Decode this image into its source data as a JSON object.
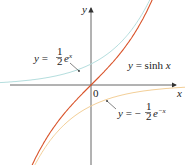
{
  "chart_data": {
    "type": "line",
    "title": "",
    "xlabel": "x",
    "ylabel": "y",
    "origin_label": "0",
    "xlim": [
      -2.2,
      2.0
    ],
    "ylim": [
      -1.9,
      2.0
    ],
    "grid": false,
    "series": [
      {
        "name": "y = sinh x",
        "function": "sinh(x)",
        "color": "#d9542b"
      },
      {
        "name": "y = 1/2 e^x",
        "function": "0.5*exp(x)",
        "color": "#a8d8d8"
      },
      {
        "name": "y = -1/2 e^-x",
        "function": "-0.5*exp(-x)",
        "color": "#f2c98a"
      }
    ],
    "annotations": [
      {
        "text": "y = ½ eˣ",
        "target": "y = 1/2 e^x"
      },
      {
        "text": "y = sinh x",
        "target": "y = sinh x"
      },
      {
        "text": "y = −½ e⁻ˣ",
        "target": "y = -1/2 e^-x"
      }
    ]
  },
  "labels": {
    "y_axis": "y",
    "x_axis": "x",
    "origin": "0",
    "exp_pos": "y = ",
    "sinh": "y = sinh x",
    "exp_neg": "y = −"
  }
}
